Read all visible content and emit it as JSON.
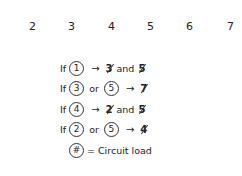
{
  "header_numbers": [
    "2",
    "3",
    "4",
    "5",
    "6",
    "7"
  ],
  "rules": [
    {
      "prefix": "If",
      "inputs": [
        "1"
      ],
      "connector": "",
      "arrow": "→",
      "outputs": [
        "3",
        "5"
      ],
      "join": "and"
    },
    {
      "prefix": "If",
      "inputs": [
        "3",
        "5"
      ],
      "connector": "or",
      "arrow": "→",
      "outputs": [
        "7"
      ],
      "join": ""
    },
    {
      "prefix": "If",
      "inputs": [
        "4"
      ],
      "connector": "",
      "arrow": "→",
      "outputs": [
        "2",
        "5"
      ],
      "join": "and"
    },
    {
      "prefix": "If",
      "inputs": [
        "2",
        "5"
      ],
      "connector": "or",
      "arrow": "→",
      "outputs": [
        "4"
      ],
      "join": ""
    }
  ],
  "legend": {
    "symbol": "#",
    "text": "= Circuit load"
  }
}
